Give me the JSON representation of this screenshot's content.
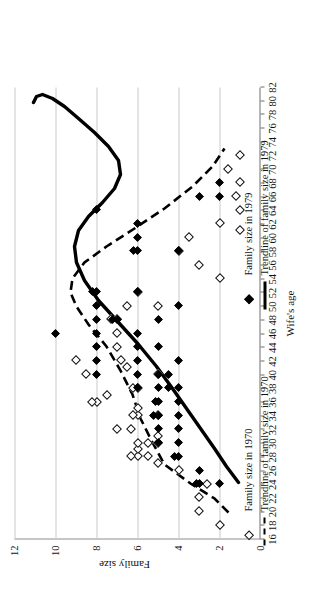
{
  "chart_data": {
    "type": "scatter",
    "title": "",
    "xlabel": "Wife's age",
    "ylabel": "Family size",
    "xlim": [
      16,
      82
    ],
    "ylim": [
      0,
      12
    ],
    "xticks": [
      16,
      18,
      20,
      22,
      24,
      26,
      28,
      30,
      32,
      34,
      36,
      38,
      40,
      42,
      44,
      46,
      48,
      50,
      52,
      54,
      56,
      58,
      60,
      62,
      64,
      66,
      68,
      70,
      72,
      74,
      76,
      78,
      80,
      82
    ],
    "yticks": [
      0,
      2,
      4,
      6,
      8,
      10,
      12
    ],
    "grid": "horizontal-gridlines-on-family-size",
    "legend_position": "below-plot",
    "series": [
      {
        "name": "Family size in 1970",
        "marker": "open-diamond",
        "points": [
          [
            18,
            2
          ],
          [
            20,
            3
          ],
          [
            22,
            3
          ],
          [
            24,
            2.6
          ],
          [
            26,
            4
          ],
          [
            27,
            5
          ],
          [
            28,
            5.5
          ],
          [
            28,
            6
          ],
          [
            28,
            6.3
          ],
          [
            29,
            6
          ],
          [
            30,
            5
          ],
          [
            30,
            5.5
          ],
          [
            30,
            6
          ],
          [
            31,
            5
          ],
          [
            32,
            6.3
          ],
          [
            32,
            7
          ],
          [
            34,
            5
          ],
          [
            34,
            6
          ],
          [
            34,
            6.2
          ],
          [
            35,
            6
          ],
          [
            36,
            8
          ],
          [
            36,
            8.2
          ],
          [
            37,
            7.5
          ],
          [
            38,
            6
          ],
          [
            38,
            6.2
          ],
          [
            40,
            5
          ],
          [
            40,
            8.5
          ],
          [
            41,
            6.5
          ],
          [
            42,
            6.8
          ],
          [
            42,
            9
          ],
          [
            44,
            7
          ],
          [
            46,
            7
          ],
          [
            48,
            7
          ],
          [
            48,
            7.3
          ],
          [
            50,
            5
          ],
          [
            50,
            6.5
          ],
          [
            52,
            6
          ],
          [
            54,
            2
          ],
          [
            56,
            3
          ],
          [
            58,
            4
          ],
          [
            60,
            3.5
          ],
          [
            61,
            1
          ],
          [
            62,
            2
          ],
          [
            64,
            1
          ],
          [
            66,
            1.2
          ],
          [
            68,
            1
          ],
          [
            70,
            1.6
          ],
          [
            72,
            1
          ]
        ]
      },
      {
        "name": "Family size in 1979",
        "marker": "filled-diamond",
        "points": [
          [
            24,
            2
          ],
          [
            24,
            3
          ],
          [
            24,
            3.1
          ],
          [
            26,
            3
          ],
          [
            28,
            4
          ],
          [
            28,
            4.2
          ],
          [
            30,
            4
          ],
          [
            30,
            5
          ],
          [
            32,
            4
          ],
          [
            32,
            5
          ],
          [
            34,
            4
          ],
          [
            34,
            5
          ],
          [
            34,
            5.2
          ],
          [
            36,
            4
          ],
          [
            36,
            5
          ],
          [
            36,
            5.1
          ],
          [
            38,
            4.5
          ],
          [
            38,
            5
          ],
          [
            38,
            6
          ],
          [
            38,
            4
          ],
          [
            40,
            4.5
          ],
          [
            40,
            5
          ],
          [
            40,
            6
          ],
          [
            40,
            8
          ],
          [
            42,
            4
          ],
          [
            42,
            6
          ],
          [
            42,
            8
          ],
          [
            44,
            5
          ],
          [
            44,
            6
          ],
          [
            44,
            8
          ],
          [
            46,
            6
          ],
          [
            46,
            8
          ],
          [
            46,
            10
          ],
          [
            48,
            5
          ],
          [
            48,
            7
          ],
          [
            48,
            7.2
          ],
          [
            48,
            8
          ],
          [
            50,
            4
          ],
          [
            50,
            8
          ],
          [
            52,
            6
          ],
          [
            52,
            8
          ],
          [
            52,
            8.2
          ],
          [
            58,
            4
          ],
          [
            58,
            6
          ],
          [
            58,
            6.2
          ],
          [
            60,
            6
          ],
          [
            62,
            6
          ],
          [
            64,
            8
          ],
          [
            66,
            2
          ],
          [
            66,
            3
          ],
          [
            68,
            2
          ]
        ]
      }
    ],
    "trendlines": [
      {
        "name": "Trendline of family size in 1970",
        "style": "dashed",
        "description": "rises from about 2 at age 20 to a peak near 7.5 around age 46-50, then falls to about 1 by age 72"
      },
      {
        "name": "Trendline of family size in 1979",
        "style": "solid",
        "description": "rises from about 2 at age 24 to a peak near 7 around age 48-52, dips near 5 at age 62-68, then rises to about 2 and curls back at age 78-80"
      }
    ]
  },
  "axes": {
    "x_title": "Wife's age",
    "y_title": "Family size",
    "x_tick_labels": [
      "16",
      "18",
      "20",
      "22",
      "24",
      "26",
      "28",
      "30",
      "32",
      "34",
      "36",
      "38",
      "40",
      "42",
      "44",
      "46",
      "48",
      "50",
      "52",
      "54",
      "56",
      "58",
      "60",
      "62",
      "64",
      "66",
      "68",
      "70",
      "72",
      "74",
      "76",
      "78",
      "80",
      "82"
    ],
    "y_tick_labels": [
      "0",
      "2",
      "4",
      "6",
      "8",
      "10",
      "12"
    ]
  },
  "legend": {
    "column_left": [
      {
        "label": "Family size in 1970",
        "symbol": "open-diamond"
      },
      {
        "label": "Trendline of family size in 1970",
        "symbol": "dashed-line"
      }
    ],
    "column_right": [
      {
        "label": "Family size in 1979",
        "symbol": "filled-diamond"
      },
      {
        "label": "Trendline of family size in 1979",
        "symbol": "solid-line"
      }
    ]
  },
  "colors": {
    "marker_1979": "#000000",
    "marker_1970_fill": "#ffffff",
    "marker_1970_stroke": "#111111",
    "trendline": "#000000",
    "gridline": "#c9c9c9",
    "axis": "#6f6f6f",
    "background": "#ffffff"
  }
}
